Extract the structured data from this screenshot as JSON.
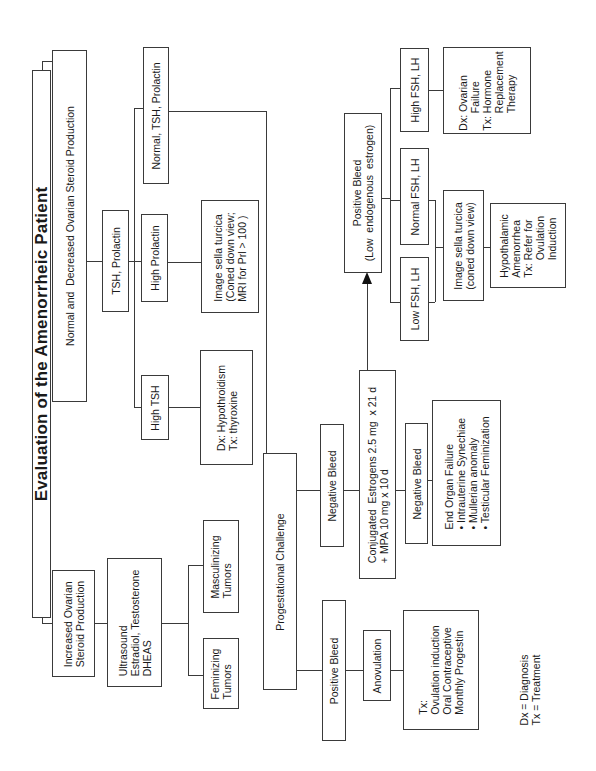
{
  "title": "Evaluation of the Amenorrheic Patient",
  "nodes": {
    "increased": "Increased Ovarian\nSteroid Production",
    "normal_decreased": "Normal and  Decreased Ovarian Steroid Production",
    "ultrasound": "Ultrasound\nEstradiol, Testosterone\nDHEAS",
    "tsh_prolactin": "TSH, Prolactin",
    "feminizing": "Feminizing\nTumors",
    "masculinizing": "Masculinizing\nTumors",
    "high_tsh": "High TSH",
    "high_prolactin": "High Prolactin",
    "normal_tsh_prolactin": "Normal, TSH, Prolactin",
    "hypothyroidism": "Dx: Hypothroidism\nTx: thyroxine",
    "sella_mri": "Image sella turcica\n(Coned down view;\nMRI for Prl > 100 )",
    "progestational": "Progestational Challenge",
    "negative_bleed_1": "Negative Bleed",
    "positive_bleed_1": "Positive Bleed",
    "conjugated_estrogens": "Conjugated  Estrogens 2.5 mg  x 21 d\n+ MPA 10 mg x 10 d",
    "anovulation": "Anovulation",
    "anovulation_tx": "Tx:\nOvulation induction\nOral Contraceptive\nMonthly Progestin",
    "negative_bleed_2": "Negative Bleed",
    "end_organ_failure": "End Organ Failure\n• Intrauterine Synechiae\n• Mullerian anomaly\n• Testicular Feminization",
    "positive_bleed_2": "Positive Bleed\n(Low  endogenous  estrogen)",
    "low_fsh_lh": "Low FSH, LH",
    "normal_fsh_lh": "Normal FSH, LH",
    "high_fsh_lh": "High FSH, LH",
    "sella_coned": "Image sella turcica\n(coned down view)",
    "ovarian_failure": "Dx: Ovarian\n      Failure\nTx: Hormone\n      Replacement\n      Therapy",
    "hypothalamic": "Hypothalamic\nAmenorrhea\nTx: Refer for\n      Ovulation\n      Induction"
  },
  "legend": "Dx = Diagnosis\nTx = Treatment"
}
